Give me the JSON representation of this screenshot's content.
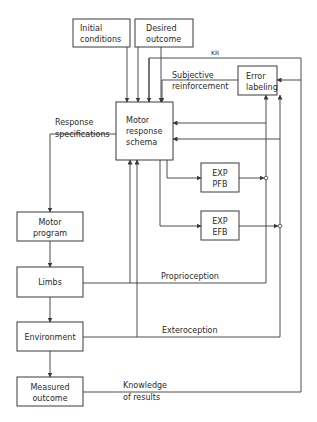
{
  "diagram": {
    "boxes": {
      "initial_conditions": [
        "Initial",
        "conditions"
      ],
      "desired_outcome": [
        "Desired",
        "outcome"
      ],
      "motor_response_schema": [
        "Motor",
        "response",
        "schema"
      ],
      "error_labeling": [
        "Error",
        "labeling"
      ],
      "exp_pfb": [
        "EXP",
        "PFB"
      ],
      "exp_efb": [
        "EXP",
        "EFB"
      ],
      "motor_program": [
        "Motor",
        "program"
      ],
      "limbs": [
        "Limbs"
      ],
      "environment": [
        "Environment"
      ],
      "measured_outcome": [
        "Measured",
        "outcome"
      ]
    },
    "labels": {
      "response_specifications": [
        "Response",
        "specifications"
      ],
      "subjective_reinforcement": [
        "Subjective",
        "reinforcement"
      ],
      "proprioception": "Proprioception",
      "exteroception": "Exteroception",
      "knowledge_of_results": [
        "Knowledge",
        "of results"
      ],
      "kr_marker": "KR"
    }
  }
}
